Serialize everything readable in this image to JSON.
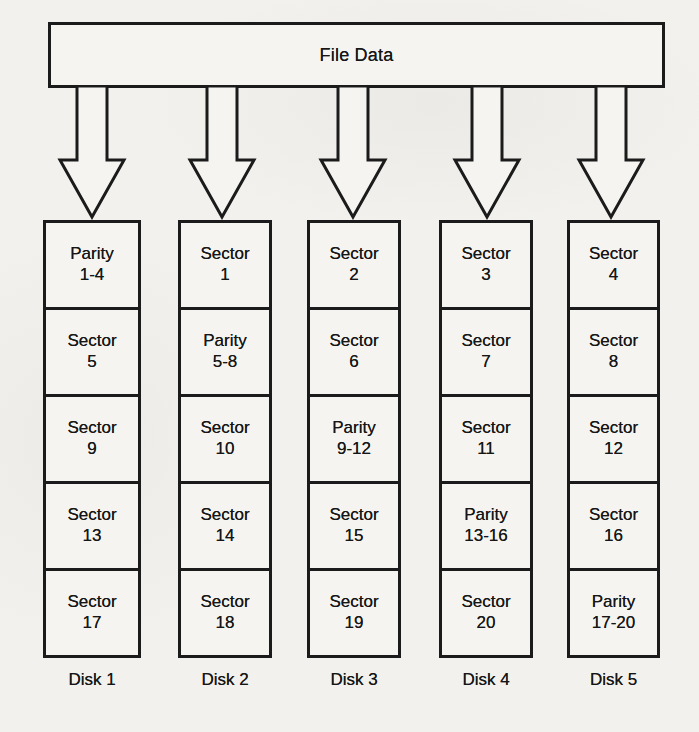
{
  "diagram": {
    "source_label": "File Data",
    "disks": [
      {
        "name": "Disk 1",
        "cells": [
          "Parity\n1-4",
          "Sector\n5",
          "Sector\n9",
          "Sector\n13",
          "Sector\n17"
        ]
      },
      {
        "name": "Disk 2",
        "cells": [
          "Sector\n1",
          "Parity\n5-8",
          "Sector\n10",
          "Sector\n14",
          "Sector\n18"
        ]
      },
      {
        "name": "Disk 3",
        "cells": [
          "Sector\n2",
          "Sector\n6",
          "Parity\n9-12",
          "Sector\n15",
          "Sector\n19"
        ]
      },
      {
        "name": "Disk 4",
        "cells": [
          "Sector\n3",
          "Sector\n7",
          "Sector\n11",
          "Parity\n13-16",
          "Sector\n20"
        ]
      },
      {
        "name": "Disk 5",
        "cells": [
          "Sector\n4",
          "Sector\n8",
          "Sector\n12",
          "Sector\n16",
          "Parity\n17-20"
        ]
      }
    ],
    "colors": {
      "line": "#1b1b1b",
      "paper": "#f2f1ed",
      "box_fill": "#f5f4f0"
    }
  }
}
